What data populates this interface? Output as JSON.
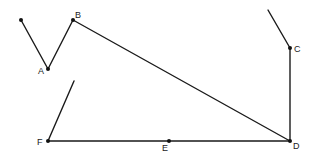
{
  "diagram": {
    "title": "",
    "background": "#ffffff",
    "line_color": "#1a1a1a",
    "points": [
      {
        "id": "P0",
        "label": "",
        "x": 21,
        "y": 20,
        "dot": true
      },
      {
        "id": "A",
        "label": "A",
        "x": 48,
        "y": 69,
        "dot": true,
        "lx": 38,
        "ly": 74
      },
      {
        "id": "B",
        "label": "B",
        "x": 73,
        "y": 20,
        "dot": true,
        "lx": 75,
        "ly": 18
      },
      {
        "id": "C",
        "label": "C",
        "x": 290,
        "y": 48,
        "dot": true,
        "lx": 294,
        "ly": 52
      },
      {
        "id": "D",
        "label": "D",
        "x": 290,
        "y": 141,
        "dot": true,
        "lx": 293,
        "ly": 149
      },
      {
        "id": "E",
        "label": "E",
        "x": 169,
        "y": 141,
        "dot": true,
        "lx": 162,
        "ly": 151
      },
      {
        "id": "F",
        "label": "F",
        "x": 48,
        "y": 141,
        "dot": true,
        "lx": 37,
        "ly": 145
      }
    ],
    "segments": [
      {
        "from": [
          21,
          20
        ],
        "to": [
          48,
          69
        ]
      },
      {
        "from": [
          48,
          69
        ],
        "to": [
          73,
          20
        ]
      },
      {
        "from": [
          73,
          20
        ],
        "to": [
          290,
          141
        ]
      },
      {
        "from": [
          268,
          10
        ],
        "to": [
          290,
          48
        ]
      },
      {
        "from": [
          290,
          48
        ],
        "to": [
          290,
          141
        ]
      },
      {
        "from": [
          48,
          141
        ],
        "to": [
          290,
          141
        ]
      },
      {
        "from": [
          48,
          141
        ],
        "to": [
          74,
          81
        ]
      }
    ]
  }
}
